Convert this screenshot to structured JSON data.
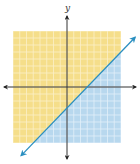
{
  "chart_data": {
    "type": "inequality-graph",
    "title": "",
    "xlabel": "",
    "ylabel": "y",
    "xlim": [
      -8,
      8
    ],
    "ylim": [
      -8,
      8
    ],
    "grid": true,
    "grid_step": 1,
    "boundary_line": {
      "equation": "y = x - 3",
      "slope": 1,
      "intercept": -3,
      "style": "solid",
      "x_intercept": 3,
      "y_intercept": -3,
      "color": "#2A8FC0"
    },
    "regions": [
      {
        "name": "above-line",
        "description": "y > x - 3",
        "color": "#F5DE8A"
      },
      {
        "name": "below-line",
        "description": "y < x - 3 (solution region, shaded)",
        "color": "#B8D8EE"
      }
    ],
    "legend": []
  },
  "labels": {
    "y_axis": "y"
  },
  "colors": {
    "yellow_fill": "#F5DE8A",
    "yellow_grid": "#FBF0C8",
    "blue_fill": "#B8D8EE",
    "blue_grid": "#E2F0F9",
    "line": "#2A8FC0",
    "axis": "#333333"
  }
}
